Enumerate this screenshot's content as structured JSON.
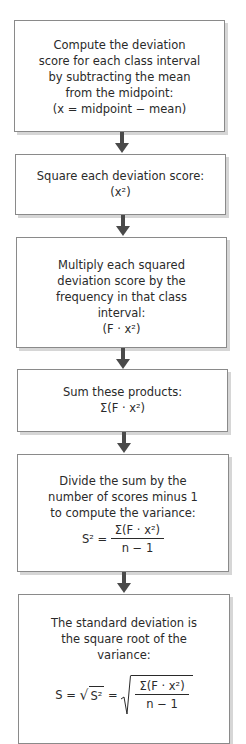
{
  "flowchart": {
    "steps": [
      {
        "lines": [
          "Compute the deviation",
          "score for each class interval",
          "by subtracting the mean",
          "from the midpoint:"
        ],
        "formula": "(x = midpoint − mean)"
      },
      {
        "lines": [
          "Square each deviation score:"
        ],
        "formula": "(x²)"
      },
      {
        "lines": [
          "Multiply each squared",
          "deviation score by the",
          "frequency in that class",
          "interval:"
        ],
        "formula": "(F · x²)"
      },
      {
        "lines": [
          "Sum these products:"
        ],
        "formula": "Σ(F · x²)"
      },
      {
        "lines": [
          "Divide the sum by the",
          "number of scores minus 1",
          "to compute the variance:"
        ],
        "formula": {
          "lhs": "S² =",
          "numerator": "Σ(F · x²)",
          "denominator": "n − 1"
        }
      },
      {
        "lines": [
          "The standard deviation is",
          "the square root of the",
          "variance:"
        ],
        "formula": {
          "lhs": "S =",
          "sqrt_inner": "S²",
          "eq": "=",
          "numerator": "Σ(F · x²)",
          "denominator": "n − 1"
        }
      }
    ],
    "arrow_color": "#4a4a4a",
    "border_color": "#8a8a8a",
    "shadow_color": "#d6d6d6"
  }
}
